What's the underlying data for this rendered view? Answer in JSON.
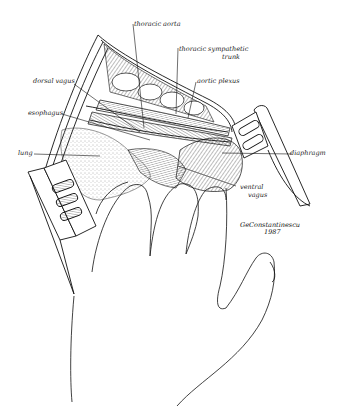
{
  "figure": {
    "labels": {
      "thoracic_aorta": "thoracic aorta",
      "thoracic_sympathetic_trunk_line1": "thoracic sympathetic",
      "thoracic_sympathetic_trunk_line2": "trunk",
      "dorsal_vagus": "dorsal vagus",
      "aortic_plexus": "aortic plexus",
      "esophagus": "esophagus",
      "lung": "lung",
      "diaphragm": "diaphragm",
      "ventral_vagus_line1": "ventral",
      "ventral_vagus_line2": "vagus"
    },
    "signature": {
      "name": "GeConstantinescu",
      "year": "1987"
    },
    "colors": {
      "ink": "#111111",
      "background": "#ffffff",
      "stipple": "#555555"
    }
  }
}
